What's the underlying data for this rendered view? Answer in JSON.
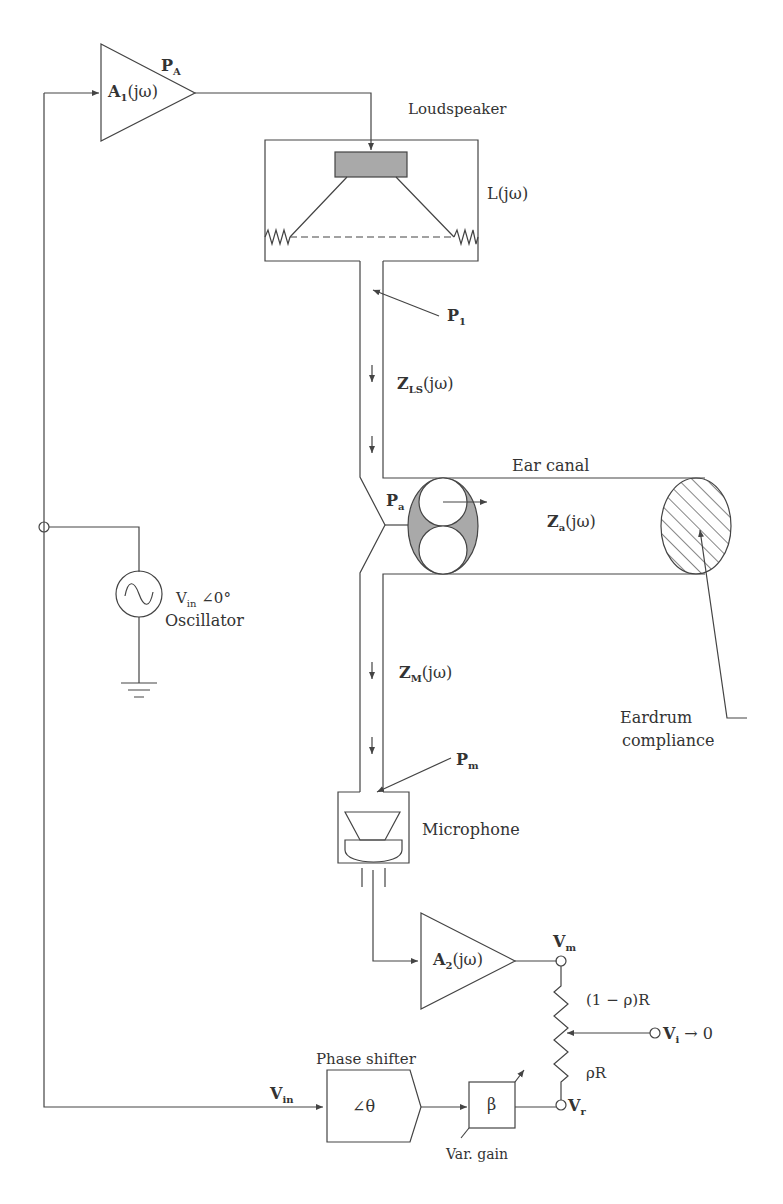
{
  "diagram": {
    "amplifier1": {
      "name": "A",
      "sub": "1",
      "suffix": "(jω)",
      "out_label": "P",
      "out_sub": "A"
    },
    "loudspeaker": {
      "label": "Loudspeaker",
      "transfer": "L(jω)"
    },
    "tube_ls": {
      "point": "P",
      "point_sub": "1",
      "impedance": "Z",
      "impedance_sub": "LS",
      "impedance_suffix": "(jω)"
    },
    "ear_canal": {
      "label": "Ear canal",
      "point": "P",
      "point_sub": "a",
      "impedance": "Z",
      "impedance_sub": "a",
      "impedance_suffix": "(jω)"
    },
    "eardrum": {
      "line1": "Eardrum",
      "line2": "compliance"
    },
    "oscillator": {
      "v": "V",
      "v_sub": "in",
      "angle": "∠0°",
      "label": "Oscillator"
    },
    "tube_mic": {
      "impedance": "Z",
      "impedance_sub": "M",
      "impedance_suffix": "(jω)",
      "point": "P",
      "point_sub": "m"
    },
    "microphone": {
      "label": "Microphone"
    },
    "amplifier2": {
      "name": "A",
      "sub": "2",
      "suffix": "(jω)"
    },
    "potentiometer": {
      "vm": "V",
      "vm_sub": "m",
      "upper": "(1 − ρ)R",
      "lower": "ρR",
      "vi": "V",
      "vi_sub": "i",
      "vi_suffix": "→ 0",
      "vr": "V",
      "vr_sub": "r"
    },
    "phase_shifter": {
      "label": "Phase shifter",
      "symbol": "∠θ",
      "input": "V",
      "input_sub": "in"
    },
    "gain": {
      "symbol": "β",
      "label": "Var. gain"
    }
  },
  "colors": {
    "stroke": "#444444",
    "fill_gray": "#a9a9a9",
    "text": "#333333"
  }
}
